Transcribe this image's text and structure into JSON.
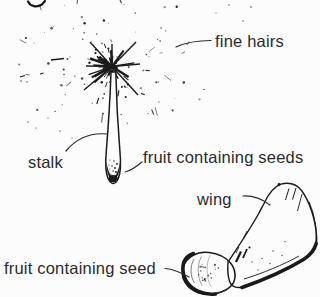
{
  "figure": {
    "background_color": "#fcfcfc",
    "ink_color": "#1a1a1a",
    "text_color": "#2b2b2b",
    "labels": {
      "fine_hairs": "fine hairs",
      "stalk": "stalk",
      "fruit_containing_seeds": "fruit containing seeds",
      "wing": "wing",
      "fruit_containing_seed": "fruit containing seed"
    },
    "drawings": [
      {
        "name": "dandelion-fruit-illustration"
      },
      {
        "name": "winged-fruit-illustration"
      }
    ]
  }
}
